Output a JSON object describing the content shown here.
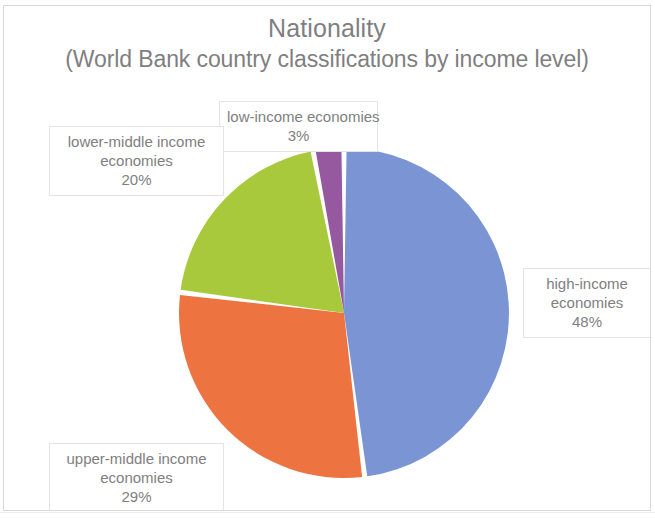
{
  "chart_data": {
    "type": "pie",
    "title": "Nationality",
    "subtitle": "(World Bank country classifications by income level)",
    "xlabel": "",
    "ylabel": "",
    "legend": "none",
    "grid": false,
    "start_angle_deg": 0,
    "direction": "clockwise",
    "categories": [
      "high-income economies",
      "upper-middle income economies",
      "lower-middle income economies",
      "low-income economies"
    ],
    "values": [
      48,
      29,
      20,
      3
    ],
    "value_unit": "%",
    "colors": [
      "#7b95d4",
      "#ed7340",
      "#a8c93c",
      "#96589f"
    ],
    "slices": [
      {
        "name": "high-income economies",
        "value": 48,
        "label_lines": [
          "high-income",
          "economies"
        ],
        "value_label": "48%",
        "color": "#7b95d4"
      },
      {
        "name": "upper-middle income economies",
        "value": 29,
        "label_lines": [
          "upper-middle income",
          "economies"
        ],
        "value_label": "29%",
        "color": "#ed7340"
      },
      {
        "name": "lower-middle income economies",
        "value": 20,
        "label_lines": [
          "lower-middle income",
          "economies"
        ],
        "value_label": "20%",
        "color": "#a8c93c"
      },
      {
        "name": "low-income economies",
        "value": 3,
        "label_lines": [
          "low-income economies"
        ],
        "value_label": "3%",
        "color": "#96589f"
      }
    ]
  },
  "labels": {
    "low": {
      "line1": "low-income economies",
      "pct": "3%"
    },
    "lower_middle": {
      "line1": "lower-middle income",
      "line2": "economies",
      "pct": "20%"
    },
    "high": {
      "line1": "high-income",
      "line2": "economies",
      "pct": "48%"
    },
    "upper_middle": {
      "line1": "upper-middle income",
      "line2": "economies",
      "pct": "29%"
    }
  },
  "style": {
    "text_color": "#7f7f7f",
    "label_border": "#e4e4e4",
    "frame_border": "#d9d9d9",
    "background": "#ffffff"
  }
}
